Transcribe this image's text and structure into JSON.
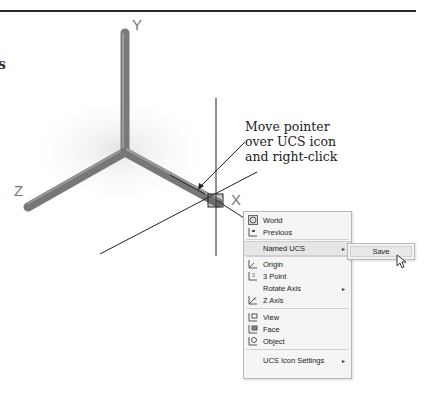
{
  "figure": {
    "edge_glyph": "s",
    "axes_labels": {
      "x": "X",
      "y": "Y",
      "z": "Z"
    },
    "callout": {
      "lines": [
        "Move pointer",
        "over UCS icon",
        "and right-click"
      ]
    }
  },
  "context_menu": {
    "items": [
      {
        "label": "World",
        "icon": "ucs-world-icon",
        "submenu": false
      },
      {
        "label": "Previous",
        "icon": "ucs-previous-icon",
        "submenu": false
      },
      {
        "label": "Named UCS",
        "icon": "",
        "submenu": true,
        "highlighted": true
      },
      {
        "label": "Origin",
        "icon": "ucs-origin-icon",
        "submenu": false
      },
      {
        "label": "3 Point",
        "icon": "ucs-3point-icon",
        "submenu": false
      },
      {
        "label": "Rotate Axis",
        "icon": "",
        "submenu": true
      },
      {
        "label": "Z Axis",
        "icon": "ucs-zaxis-icon",
        "submenu": false
      },
      {
        "label": "View",
        "icon": "ucs-view-icon",
        "submenu": false
      },
      {
        "label": "Face",
        "icon": "ucs-face-icon",
        "submenu": false
      },
      {
        "label": "Object",
        "icon": "ucs-object-icon",
        "submenu": false
      },
      {
        "label": "UCS Icon Settings",
        "icon": "",
        "submenu": true
      }
    ],
    "submenu_arrow": "▸"
  },
  "submenu": {
    "items": [
      {
        "label": "Save"
      }
    ]
  }
}
